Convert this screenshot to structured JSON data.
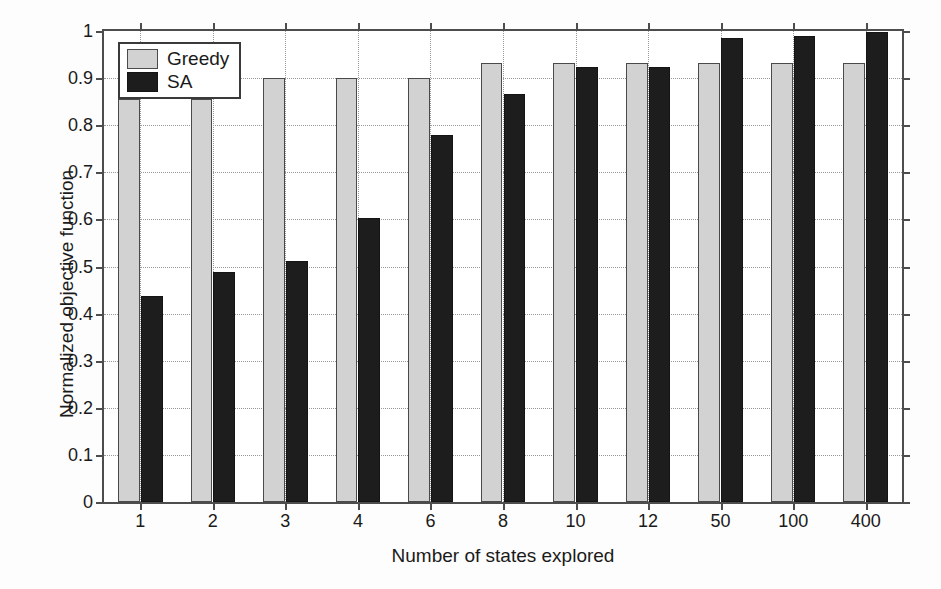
{
  "chart_data": {
    "type": "bar",
    "title": "",
    "xlabel": "Number of states explored",
    "ylabel": "Normalized objective function",
    "categories": [
      "1",
      "2",
      "3",
      "4",
      "6",
      "8",
      "10",
      "12",
      "50",
      "100",
      "400"
    ],
    "series": [
      {
        "name": "Greedy",
        "color": "#d2d2d2",
        "values": [
          0.855,
          0.855,
          0.9,
          0.9,
          0.9,
          0.932,
          0.932,
          0.932,
          0.932,
          0.932,
          0.932
        ]
      },
      {
        "name": "SA",
        "color": "#1d1d1d",
        "values": [
          0.437,
          0.489,
          0.512,
          0.603,
          0.78,
          0.867,
          0.923,
          0.923,
          0.985,
          0.99,
          0.997
        ]
      }
    ],
    "ylim": [
      0,
      1
    ],
    "yticks": [
      "0",
      "0.1",
      "0.2",
      "0.3",
      "0.4",
      "0.5",
      "0.6",
      "0.7",
      "0.8",
      "0.9",
      "1"
    ],
    "ytick_values": [
      0,
      0.1,
      0.2,
      0.3,
      0.4,
      0.5,
      0.6,
      0.7,
      0.8,
      0.9,
      1
    ],
    "grid": true,
    "grid_style": "dotted",
    "legend_position": "top-left"
  },
  "legend": {
    "entries": [
      {
        "label": "Greedy",
        "swatch": "greedy"
      },
      {
        "label": "SA",
        "swatch": "sa"
      }
    ]
  },
  "axes": {
    "x_title": "Number of states explored",
    "y_title": "Normalized objective function"
  }
}
